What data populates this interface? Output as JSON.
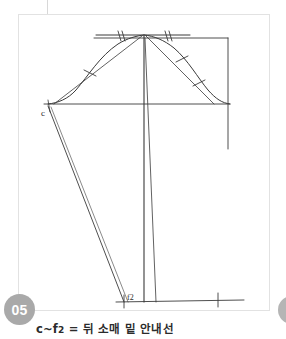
{
  "page": {
    "step_badge": "05",
    "caption": "c~f2 = 뒤 소매 밑 안내선",
    "caption_prefix": "c~f",
    "caption_sub": "2",
    "caption_rest": " = 뒤 소매 밑 안내선"
  },
  "colors": {
    "background": "#ffffff",
    "card_border": "#e2e2e2",
    "draft_line": "#3a3a3a",
    "draft_line_light": "#6e6e6e",
    "badge_fill": "#a9a9a9",
    "badge_text": "#ffffff",
    "caption_text": "#2b2b2b"
  },
  "diagram": {
    "type": "sleeve-cap-pattern-draft",
    "labels": [
      {
        "name": "point-c",
        "text": "c",
        "x": 24,
        "y": 98
      },
      {
        "name": "point-f2",
        "text": "f2",
        "x": 108,
        "y": 284
      }
    ],
    "notches": {
      "top_double_left": 2,
      "top_double_right": 2,
      "left_diagonal_single": 1,
      "right_diagonal_single": 1,
      "right_diagonal_double": 2,
      "hem_right_cross": 1
    }
  }
}
